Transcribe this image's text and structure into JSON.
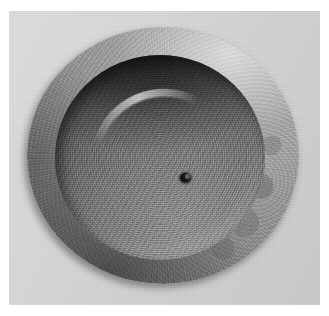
{
  "image": {
    "kind": "photograph",
    "subject": "machined circular metal disc with concave bowl and central hole",
    "color_mode": "grayscale",
    "width_px": 329,
    "height_px": 316,
    "alt_text": "Top-down grayscale photograph of a round machined metal disc with a broad flat outer flange, a deep concave inner bowl and a small dark hole at the exact centre, resting on a light grey surface.",
    "border": {
      "name": "white-photo-margin",
      "color": "#ffffff",
      "left_px": 9,
      "top_px": 11,
      "right_px": 9,
      "bottom_px": 11
    }
  },
  "background": {
    "name": "light-grey-surface",
    "color_light": "#d9d9d9",
    "color_dark": "#c6c6c6",
    "texture": "fine film grain"
  },
  "objects": {
    "outer_disc": {
      "name": "outer-flange-ring",
      "shape": "circle",
      "center_x_px": 163,
      "center_y_px": 155,
      "width_px": 272,
      "height_px": 257,
      "color_light": "#b4b4b4",
      "color_mid": "#8e8e8e",
      "color_dark": "#676767",
      "finish": "brushed radial machining marks with mottled pitting on the right side",
      "cast_shadow": "lower-left, soft"
    },
    "inner_bowl": {
      "name": "concave-inner-bowl",
      "shape": "circle",
      "center_x_px": 160,
      "center_y_px": 158,
      "width_px": 210,
      "height_px": 205,
      "color_light": "#8c8c8c",
      "color_mid": "#5e5e5e",
      "color_dark": "#323232",
      "finish": "circular turning grooves with diagonal brush streaks",
      "shadow_region": "upper portion",
      "highlight_region": "lower-right crescent"
    },
    "center_hole": {
      "name": "center-hole",
      "shape": "circle",
      "center_x_px": 158,
      "center_y_px": 151,
      "diameter_px": 11,
      "color": "#060606",
      "detail": "small bright burr chip visible on the upper-right of the bore"
    }
  },
  "lighting": {
    "name": "key-light",
    "direction": "upper-right",
    "highlight_color": "#ffffff",
    "shadow_color": "#1a1a1a"
  }
}
